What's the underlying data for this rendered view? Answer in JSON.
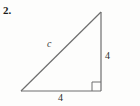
{
  "figure": {
    "problem_number": "2.",
    "shape": "right-triangle",
    "background_color": "#fdfdfc",
    "stroke_color": "#6e6e6e",
    "text_color": "#1a1a1a",
    "vertices": {
      "apex_top_right": [
        101,
        12
      ],
      "corner_bottom_right": [
        101,
        91
      ],
      "corner_bottom_left": [
        21,
        91
      ]
    },
    "right_angle_marker": {
      "present": true,
      "at_vertex": "corner_bottom_right",
      "size": 9
    },
    "labels": {
      "hypotenuse": "c",
      "vertical_leg": "4",
      "horizontal_leg": "4"
    }
  }
}
